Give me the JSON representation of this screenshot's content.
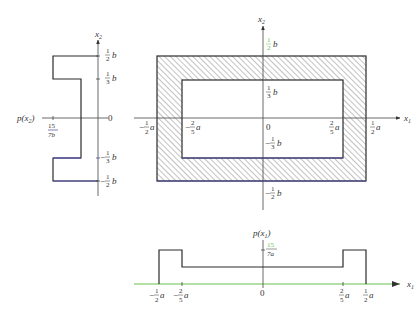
{
  "diagram": {
    "colors": {
      "line": "#2b2b2b",
      "axis": "#444444",
      "hatch": "#555555",
      "accent_green": "#6abf4b",
      "accent_blue": "#4a4aa0"
    },
    "left_plot": {
      "name": "marginal-p-x2",
      "axis_label": "x",
      "axis_label_sub": "2",
      "density_label": "p(x",
      "density_label_sub": "2",
      "density_label_close": ")",
      "density_value_num": "15",
      "density_value_den": "7b",
      "zero": "0",
      "ticks": [
        {
          "num": "1",
          "den": "2",
          "unit": "b",
          "sign": ""
        },
        {
          "num": "1",
          "den": "3",
          "unit": "b",
          "sign": ""
        },
        {
          "num": "1",
          "den": "3",
          "unit": "b",
          "sign": "−"
        },
        {
          "num": "1",
          "den": "2",
          "unit": "b",
          "sign": "−"
        }
      ]
    },
    "main_plot": {
      "name": "support-region",
      "x_axis_label": "x",
      "x_axis_sub": "1",
      "y_axis_label": "x",
      "y_axis_sub": "2",
      "zero": "0",
      "x_ticks": [
        {
          "sign": "−",
          "num": "1",
          "den": "2",
          "unit": "a"
        },
        {
          "sign": "−",
          "num": "2",
          "den": "5",
          "unit": "a"
        },
        {
          "sign": "",
          "num": "2",
          "den": "5",
          "unit": "a"
        },
        {
          "sign": "",
          "num": "1",
          "den": "2",
          "unit": "a"
        }
      ],
      "y_ticks": [
        {
          "sign": "",
          "num": "1",
          "den": "2",
          "unit": "b"
        },
        {
          "sign": "",
          "num": "1",
          "den": "3",
          "unit": "b"
        },
        {
          "sign": "−",
          "num": "1",
          "den": "3",
          "unit": "b"
        },
        {
          "sign": "−",
          "num": "1",
          "den": "2",
          "unit": "b"
        }
      ]
    },
    "bottom_plot": {
      "name": "marginal-p-x1",
      "axis_label": "x",
      "axis_label_sub": "1",
      "density_label": "p(x",
      "density_label_sub": "1",
      "density_label_close": ")",
      "density_value_num": "15",
      "density_value_den": "7a",
      "zero": "0",
      "ticks": [
        {
          "sign": "−",
          "num": "1",
          "den": "2",
          "unit": "a"
        },
        {
          "sign": "−",
          "num": "2",
          "den": "5",
          "unit": "a"
        },
        {
          "sign": "",
          "num": "2",
          "den": "5",
          "unit": "a"
        },
        {
          "sign": "",
          "num": "1",
          "den": "2",
          "unit": "a"
        }
      ]
    }
  }
}
